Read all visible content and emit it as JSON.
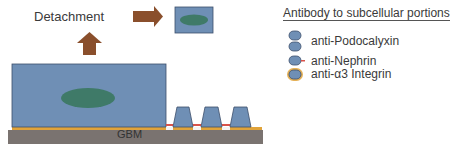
{
  "diagram": {
    "detachment_label": "Detachment",
    "gbm_label": "GBM",
    "legend": {
      "title": "Antibody to subcellular portions",
      "items": [
        {
          "label": "anti-Podocalyxin",
          "icon": "apical-cell-icon"
        },
        {
          "label": "anti-Nephrin",
          "icon": "slit-diaphragm-cell-icon"
        },
        {
          "label": "anti-α3 Integrin",
          "icon": "basal-integrin-cell-icon"
        }
      ]
    },
    "colors": {
      "cell": "#6f8fb5",
      "cell_border": "#3d4f6b",
      "nucleus": "#3f7a68",
      "arrow": "#8a4f2c",
      "gbm": "#7a7370",
      "integrin": "#e0a33a",
      "nephrin": "#d9534a"
    }
  }
}
